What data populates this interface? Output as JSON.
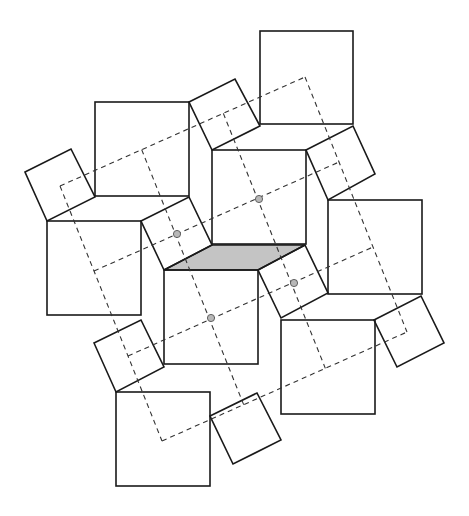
{
  "diagram": {
    "title": "",
    "colors": {
      "stroke": "#1a1a1a",
      "dash": "#333333",
      "shade": "#c4c4c4",
      "dot": "#b8b8b8",
      "background": "#ffffff"
    },
    "large_squares": [
      {
        "id": "A",
        "x": 95,
        "y": 102,
        "size": 94
      },
      {
        "id": "B",
        "x": 260,
        "y": 31,
        "size": 93
      },
      {
        "id": "C",
        "x": 47,
        "y": 221,
        "size": 94
      },
      {
        "id": "D",
        "x": 212,
        "y": 150,
        "size": 94
      },
      {
        "id": "E",
        "x": 164,
        "y": 270,
        "size": 94
      },
      {
        "id": "F",
        "x": 328,
        "y": 200,
        "size": 94
      },
      {
        "id": "G",
        "x": 281,
        "y": 320,
        "size": 94
      },
      {
        "id": "H",
        "x": 116,
        "y": 392,
        "size": 94
      }
    ],
    "small_squares": [
      {
        "id": "s1",
        "points": "25,172 71,149 95,197 47,221"
      },
      {
        "id": "s2",
        "points": "189,102 235,79 260,126 212,150"
      },
      {
        "id": "s3",
        "points": "141,221 189,197 212,245 164,270"
      },
      {
        "id": "s4",
        "points": "306,150 353,126 375,174 328,200"
      },
      {
        "id": "s5",
        "points": "258,270 305,245 328,293 281,318"
      },
      {
        "id": "s6",
        "points": "94,343 141,320 164,367 116,392"
      },
      {
        "id": "s7",
        "points": "210,416 257,393 281,440 233,464"
      },
      {
        "id": "s8",
        "points": "374,320 421,296 444,343 397,367"
      }
    ],
    "shaded_parallelogram": {
      "points": "164,270 212,245 305,245 258,270"
    },
    "dashed_grid": {
      "origin": [
        60,
        186
      ],
      "u": [
        245,
        -109
      ],
      "v": [
        102,
        255
      ],
      "divisions": 3
    },
    "dots": [
      {
        "cx": 177,
        "cy": 234
      },
      {
        "cx": 259,
        "cy": 199
      },
      {
        "cx": 294,
        "cy": 283
      },
      {
        "cx": 211,
        "cy": 318
      }
    ]
  }
}
